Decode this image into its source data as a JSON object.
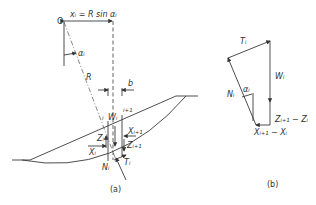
{
  "figure_a": {
    "caption": "(a)",
    "centre_label": "O",
    "offset_label": "xᵢ = R sin αᵢ",
    "angle_label": "αᵢ",
    "radius_label": "R",
    "width_label": "b",
    "slice_left_label": "i",
    "slice_right_label": "i+1",
    "weight_label": "Wᵢ",
    "z_left_label": "Zᵢ",
    "x_left_label": "Xᵢ",
    "x_right_label": "Xᵢ₊₁",
    "z_right_label": "Zᵢ₊₁",
    "normal_label": "Nᵢ",
    "shear_label": "Tᵢ"
  },
  "figure_b": {
    "caption": "(b)",
    "shear_label": "Tᵢ",
    "weight_label": "Wᵢ",
    "normal_label": "Nᵢ",
    "angle_label": "αᵢ",
    "z_diff_label": "Zᵢ₊₁ − Zᵢ",
    "x_diff_label": "Xᵢ₊₁ − Xᵢ"
  }
}
